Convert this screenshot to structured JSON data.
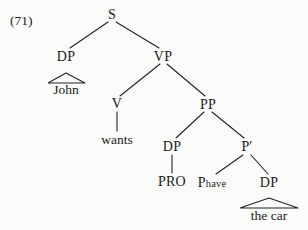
{
  "figure": {
    "example_number": "(71)",
    "type": "syntax-tree",
    "sentence": "John wants PRO P_have the car",
    "background_color": "#fbfbf9",
    "line_color": "#222222",
    "text_color": "#1a1a1a"
  },
  "nodes": {
    "s": {
      "label": "S",
      "x": 112,
      "y": 15
    },
    "dp_subject": {
      "label": "DP",
      "x": 66,
      "y": 57
    },
    "vp": {
      "label": "VP",
      "x": 163,
      "y": 57
    },
    "john": {
      "label": "John",
      "x": 66,
      "y": 90
    },
    "v": {
      "label": "V",
      "x": 117,
      "y": 104
    },
    "pp": {
      "label": "PP",
      "x": 208,
      "y": 105
    },
    "wants": {
      "label": "wants",
      "x": 117,
      "y": 140
    },
    "dp_pro": {
      "label": "DP",
      "x": 172,
      "y": 147
    },
    "p_bar": {
      "label": "P′",
      "x": 247,
      "y": 147
    },
    "pro": {
      "label": "PRO",
      "x": 172,
      "y": 182
    },
    "p_head": {
      "label_main": "P",
      "label_sub": "have",
      "x": 212,
      "y": 183
    },
    "dp_object": {
      "label": "DP",
      "x": 269,
      "y": 183
    },
    "the_car": {
      "label": "the car",
      "x": 269,
      "y": 216
    }
  },
  "edges": [
    {
      "name": "s-to-dp",
      "x1": 108,
      "y1": 22,
      "x2": 70,
      "y2": 48
    },
    {
      "name": "s-to-vp",
      "x1": 116,
      "y1": 22,
      "x2": 159,
      "y2": 48
    },
    {
      "name": "vp-to-v",
      "x1": 160,
      "y1": 64,
      "x2": 120,
      "y2": 96
    },
    {
      "name": "vp-to-pp",
      "x1": 167,
      "y1": 64,
      "x2": 205,
      "y2": 96
    },
    {
      "name": "v-to-wants",
      "x1": 117,
      "y1": 112,
      "x2": 117,
      "y2": 131
    },
    {
      "name": "pp-to-dp",
      "x1": 204,
      "y1": 112,
      "x2": 176,
      "y2": 138
    },
    {
      "name": "pp-to-pbar",
      "x1": 212,
      "y1": 112,
      "x2": 244,
      "y2": 138
    },
    {
      "name": "dp-to-pro",
      "x1": 172,
      "y1": 155,
      "x2": 172,
      "y2": 173
    },
    {
      "name": "pbar-to-p",
      "x1": 243,
      "y1": 155,
      "x2": 216,
      "y2": 174
    },
    {
      "name": "pbar-to-dp",
      "x1": 251,
      "y1": 155,
      "x2": 268,
      "y2": 174
    }
  ],
  "triangles": [
    {
      "name": "john-triangle",
      "apex_x": 66,
      "apex_y": 73,
      "left_x": 48,
      "right_x": 85,
      "base_y": 83
    },
    {
      "name": "the-car-triangle",
      "apex_x": 269,
      "apex_y": 198,
      "left_x": 240,
      "right_x": 298,
      "base_y": 208
    }
  ]
}
